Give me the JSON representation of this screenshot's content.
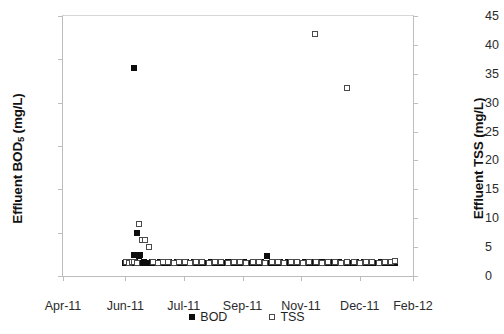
{
  "chart_data": {
    "type": "scatter",
    "title": "",
    "xlabel": "",
    "ylabel": "Effluent BOD5 (mg/L)",
    "ylabel_right": "Effluent TSS (mg/L)",
    "ylabel_left_prefix": "Effluent BOD",
    "ylabel_left_sub": "5",
    "ylabel_left_suffix": " (mg/L)",
    "grid": false,
    "legend_position": "bottom-center",
    "ylim": [
      0,
      60
    ],
    "ylim_right": [
      0,
      45
    ],
    "ytick_labels_left": [
      "0",
      "10",
      "20",
      "30",
      "40",
      "50",
      "60"
    ],
    "ytick_values_left": [
      0,
      10,
      20,
      30,
      40,
      50,
      60
    ],
    "ytick_labels_right": [
      "0",
      "5",
      "10",
      "15",
      "20",
      "25",
      "30",
      "35",
      "40",
      "45"
    ],
    "ytick_values_right": [
      0,
      5,
      10,
      15,
      20,
      25,
      30,
      35,
      40,
      45
    ],
    "xtick_labels": [
      "Apr-11",
      "Jun-11",
      "Jul-11",
      "Sep-11",
      "Nov-11",
      "Dec-11",
      "Feb-12"
    ],
    "xtick_positions_frac": [
      0.0,
      0.178,
      0.345,
      0.513,
      0.68,
      0.848,
      1.0
    ],
    "xlim_labels": [
      "Apr-11",
      "Feb-12"
    ],
    "series": [
      {
        "name": "BOD",
        "marker": "filled-square",
        "color": "#0d0d0d",
        "axis": "left",
        "unit": "mg/L",
        "points": [
          {
            "x": 0.178,
            "y": 3.1
          },
          {
            "x": 0.182,
            "y": 3.0
          },
          {
            "x": 0.186,
            "y": 3.2
          },
          {
            "x": 0.19,
            "y": 3.0
          },
          {
            "x": 0.194,
            "y": 3.1
          },
          {
            "x": 0.198,
            "y": 3.0
          },
          {
            "x": 0.202,
            "y": 4.9
          },
          {
            "x": 0.202,
            "y": 48.0
          },
          {
            "x": 0.206,
            "y": 3.2
          },
          {
            "x": 0.21,
            "y": 3.0
          },
          {
            "x": 0.212,
            "y": 10.0
          },
          {
            "x": 0.216,
            "y": 4.6
          },
          {
            "x": 0.22,
            "y": 4.8
          },
          {
            "x": 0.224,
            "y": 3.1
          },
          {
            "x": 0.228,
            "y": 3.0
          },
          {
            "x": 0.232,
            "y": 3.2
          },
          {
            "x": 0.236,
            "y": 3.0
          },
          {
            "x": 0.242,
            "y": 3.1
          },
          {
            "x": 0.248,
            "y": 3.0
          },
          {
            "x": 0.254,
            "y": 3.2
          },
          {
            "x": 0.26,
            "y": 3.0
          },
          {
            "x": 0.266,
            "y": 3.1
          },
          {
            "x": 0.272,
            "y": 3.0
          },
          {
            "x": 0.278,
            "y": 3.2
          },
          {
            "x": 0.284,
            "y": 3.0
          },
          {
            "x": 0.29,
            "y": 3.1
          },
          {
            "x": 0.296,
            "y": 3.0
          },
          {
            "x": 0.302,
            "y": 3.2
          },
          {
            "x": 0.308,
            "y": 3.0
          },
          {
            "x": 0.314,
            "y": 3.1
          },
          {
            "x": 0.32,
            "y": 3.0
          },
          {
            "x": 0.326,
            "y": 3.2
          },
          {
            "x": 0.332,
            "y": 3.0
          },
          {
            "x": 0.338,
            "y": 3.1
          },
          {
            "x": 0.344,
            "y": 3.0
          },
          {
            "x": 0.35,
            "y": 3.2
          },
          {
            "x": 0.356,
            "y": 3.0
          },
          {
            "x": 0.362,
            "y": 3.1
          },
          {
            "x": 0.368,
            "y": 3.0
          },
          {
            "x": 0.374,
            "y": 3.2
          },
          {
            "x": 0.38,
            "y": 3.0
          },
          {
            "x": 0.386,
            "y": 3.1
          },
          {
            "x": 0.392,
            "y": 3.0
          },
          {
            "x": 0.398,
            "y": 3.2
          },
          {
            "x": 0.404,
            "y": 3.0
          },
          {
            "x": 0.41,
            "y": 3.1
          },
          {
            "x": 0.416,
            "y": 3.0
          },
          {
            "x": 0.422,
            "y": 3.2
          },
          {
            "x": 0.428,
            "y": 3.0
          },
          {
            "x": 0.434,
            "y": 3.1
          },
          {
            "x": 0.44,
            "y": 3.0
          },
          {
            "x": 0.446,
            "y": 3.2
          },
          {
            "x": 0.452,
            "y": 3.0
          },
          {
            "x": 0.458,
            "y": 3.1
          },
          {
            "x": 0.464,
            "y": 3.0
          },
          {
            "x": 0.47,
            "y": 3.2
          },
          {
            "x": 0.476,
            "y": 3.0
          },
          {
            "x": 0.482,
            "y": 3.1
          },
          {
            "x": 0.488,
            "y": 3.0
          },
          {
            "x": 0.494,
            "y": 3.2
          },
          {
            "x": 0.5,
            "y": 3.0
          },
          {
            "x": 0.506,
            "y": 3.1
          },
          {
            "x": 0.512,
            "y": 3.0
          },
          {
            "x": 0.518,
            "y": 3.2
          },
          {
            "x": 0.524,
            "y": 3.0
          },
          {
            "x": 0.53,
            "y": 3.1
          },
          {
            "x": 0.536,
            "y": 3.0
          },
          {
            "x": 0.542,
            "y": 3.2
          },
          {
            "x": 0.548,
            "y": 3.0
          },
          {
            "x": 0.554,
            "y": 3.1
          },
          {
            "x": 0.56,
            "y": 3.0
          },
          {
            "x": 0.566,
            "y": 3.2
          },
          {
            "x": 0.572,
            "y": 3.0
          },
          {
            "x": 0.578,
            "y": 3.1
          },
          {
            "x": 0.583,
            "y": 4.6
          },
          {
            "x": 0.59,
            "y": 3.0
          },
          {
            "x": 0.596,
            "y": 3.2
          },
          {
            "x": 0.602,
            "y": 3.0
          },
          {
            "x": 0.608,
            "y": 3.1
          },
          {
            "x": 0.614,
            "y": 3.0
          },
          {
            "x": 0.62,
            "y": 3.2
          },
          {
            "x": 0.626,
            "y": 3.0
          },
          {
            "x": 0.632,
            "y": 3.1
          },
          {
            "x": 0.638,
            "y": 3.0
          },
          {
            "x": 0.644,
            "y": 3.2
          },
          {
            "x": 0.65,
            "y": 3.0
          },
          {
            "x": 0.656,
            "y": 3.1
          },
          {
            "x": 0.662,
            "y": 3.0
          },
          {
            "x": 0.668,
            "y": 3.2
          },
          {
            "x": 0.674,
            "y": 3.0
          },
          {
            "x": 0.68,
            "y": 3.1
          },
          {
            "x": 0.686,
            "y": 3.0
          },
          {
            "x": 0.692,
            "y": 3.2
          },
          {
            "x": 0.698,
            "y": 3.0
          },
          {
            "x": 0.704,
            "y": 3.1
          },
          {
            "x": 0.71,
            "y": 3.0
          },
          {
            "x": 0.716,
            "y": 3.2
          },
          {
            "x": 0.722,
            "y": 3.0
          },
          {
            "x": 0.728,
            "y": 3.1
          },
          {
            "x": 0.734,
            "y": 3.0
          },
          {
            "x": 0.74,
            "y": 3.2
          },
          {
            "x": 0.746,
            "y": 3.0
          },
          {
            "x": 0.752,
            "y": 3.1
          },
          {
            "x": 0.758,
            "y": 3.0
          },
          {
            "x": 0.764,
            "y": 3.2
          },
          {
            "x": 0.77,
            "y": 3.0
          },
          {
            "x": 0.776,
            "y": 3.1
          },
          {
            "x": 0.782,
            "y": 3.0
          },
          {
            "x": 0.788,
            "y": 3.2
          },
          {
            "x": 0.794,
            "y": 3.0
          },
          {
            "x": 0.8,
            "y": 3.1
          },
          {
            "x": 0.806,
            "y": 3.0
          },
          {
            "x": 0.812,
            "y": 3.2
          },
          {
            "x": 0.818,
            "y": 3.0
          },
          {
            "x": 0.824,
            "y": 3.1
          },
          {
            "x": 0.83,
            "y": 3.0
          },
          {
            "x": 0.836,
            "y": 3.2
          },
          {
            "x": 0.842,
            "y": 3.0
          },
          {
            "x": 0.848,
            "y": 3.1
          },
          {
            "x": 0.854,
            "y": 3.0
          },
          {
            "x": 0.86,
            "y": 3.2
          },
          {
            "x": 0.866,
            "y": 3.0
          },
          {
            "x": 0.872,
            "y": 3.1
          },
          {
            "x": 0.878,
            "y": 3.0
          },
          {
            "x": 0.884,
            "y": 3.2
          },
          {
            "x": 0.89,
            "y": 3.0
          },
          {
            "x": 0.896,
            "y": 3.1
          },
          {
            "x": 0.902,
            "y": 3.0
          },
          {
            "x": 0.908,
            "y": 3.2
          },
          {
            "x": 0.914,
            "y": 3.0
          },
          {
            "x": 0.92,
            "y": 3.1
          },
          {
            "x": 0.926,
            "y": 3.0
          },
          {
            "x": 0.932,
            "y": 3.2
          },
          {
            "x": 0.938,
            "y": 3.0
          },
          {
            "x": 0.944,
            "y": 3.1
          },
          {
            "x": 0.949,
            "y": 3.0
          }
        ]
      },
      {
        "name": "TSS",
        "marker": "open-square",
        "color": "#4a4a4a",
        "axis": "right",
        "unit": "mg/L",
        "points": [
          {
            "x": 0.18,
            "y": 2.4
          },
          {
            "x": 0.188,
            "y": 2.3
          },
          {
            "x": 0.196,
            "y": 2.5
          },
          {
            "x": 0.204,
            "y": 2.4
          },
          {
            "x": 0.212,
            "y": 2.3
          },
          {
            "x": 0.218,
            "y": 9.0
          },
          {
            "x": 0.226,
            "y": 6.2
          },
          {
            "x": 0.234,
            "y": 6.2
          },
          {
            "x": 0.246,
            "y": 5.0
          },
          {
            "x": 0.258,
            "y": 2.4
          },
          {
            "x": 0.272,
            "y": 2.3
          },
          {
            "x": 0.286,
            "y": 2.5
          },
          {
            "x": 0.3,
            "y": 2.4
          },
          {
            "x": 0.316,
            "y": 2.3
          },
          {
            "x": 0.332,
            "y": 2.5
          },
          {
            "x": 0.348,
            "y": 2.4
          },
          {
            "x": 0.364,
            "y": 2.3
          },
          {
            "x": 0.38,
            "y": 2.5
          },
          {
            "x": 0.398,
            "y": 2.4
          },
          {
            "x": 0.416,
            "y": 2.3
          },
          {
            "x": 0.434,
            "y": 2.5
          },
          {
            "x": 0.452,
            "y": 2.4
          },
          {
            "x": 0.47,
            "y": 2.3
          },
          {
            "x": 0.488,
            "y": 2.5
          },
          {
            "x": 0.506,
            "y": 2.4
          },
          {
            "x": 0.524,
            "y": 2.3
          },
          {
            "x": 0.542,
            "y": 2.5
          },
          {
            "x": 0.56,
            "y": 2.4
          },
          {
            "x": 0.578,
            "y": 2.3
          },
          {
            "x": 0.596,
            "y": 2.5
          },
          {
            "x": 0.614,
            "y": 2.4
          },
          {
            "x": 0.632,
            "y": 2.3
          },
          {
            "x": 0.65,
            "y": 2.5
          },
          {
            "x": 0.668,
            "y": 2.4
          },
          {
            "x": 0.686,
            "y": 2.3
          },
          {
            "x": 0.72,
            "y": 41.8
          },
          {
            "x": 0.704,
            "y": 2.5
          },
          {
            "x": 0.722,
            "y": 2.4
          },
          {
            "x": 0.74,
            "y": 2.3
          },
          {
            "x": 0.758,
            "y": 2.5
          },
          {
            "x": 0.776,
            "y": 2.4
          },
          {
            "x": 0.794,
            "y": 2.3
          },
          {
            "x": 0.812,
            "y": 2.5
          },
          {
            "x": 0.812,
            "y": 32.5
          },
          {
            "x": 0.83,
            "y": 2.4
          },
          {
            "x": 0.848,
            "y": 2.3
          },
          {
            "x": 0.866,
            "y": 2.5
          },
          {
            "x": 0.884,
            "y": 2.4
          },
          {
            "x": 0.902,
            "y": 2.3
          },
          {
            "x": 0.92,
            "y": 2.5
          },
          {
            "x": 0.938,
            "y": 2.4
          },
          {
            "x": 0.948,
            "y": 2.6
          }
        ]
      }
    ],
    "legend": [
      {
        "label": "BOD",
        "marker": "filled-square"
      },
      {
        "label": "TSS",
        "marker": "open-square"
      }
    ]
  }
}
